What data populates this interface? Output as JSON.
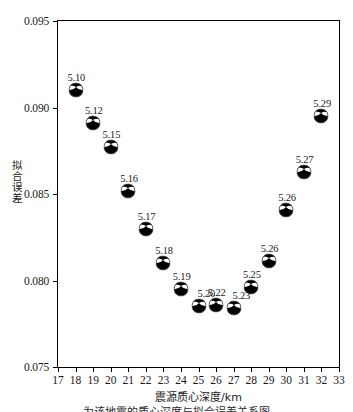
{
  "chart_data": {
    "type": "scatter",
    "title": "",
    "xlabel": "震源质心深度/km",
    "ylabel": "拟合误差",
    "xlim": [
      17,
      33
    ],
    "ylim": [
      0.075,
      0.095
    ],
    "grid": false,
    "legend": null,
    "x_ticks": [
      "17",
      "18",
      "19",
      "20",
      "21",
      "22",
      "23",
      "24",
      "25",
      "26",
      "27",
      "28",
      "29",
      "30",
      "31",
      "32",
      "33"
    ],
    "y_ticks": [
      "0.075",
      "0.080",
      "0.085",
      "0.090",
      "0.095"
    ],
    "marker": "beachball",
    "points": [
      {
        "x": 18,
        "y": 0.091,
        "label": "5.10",
        "label_pos": "center"
      },
      {
        "x": 19,
        "y": 0.0891,
        "label": "5.12",
        "label_pos": "center"
      },
      {
        "x": 20,
        "y": 0.0877,
        "label": "5.15",
        "label_pos": "center"
      },
      {
        "x": 21,
        "y": 0.0852,
        "label": "5.16",
        "label_pos": "center"
      },
      {
        "x": 22,
        "y": 0.083,
        "label": "5.17",
        "label_pos": "center"
      },
      {
        "x": 23,
        "y": 0.081,
        "label": "5.18",
        "label_pos": "center"
      },
      {
        "x": 24,
        "y": 0.0795,
        "label": "5.19",
        "label_pos": "center"
      },
      {
        "x": 25,
        "y": 0.0785,
        "label": "5.20",
        "label_pos": "right"
      },
      {
        "x": 26,
        "y": 0.0786,
        "label": "5.22",
        "label_pos": "center"
      },
      {
        "x": 27,
        "y": 0.0784,
        "label": "5.23",
        "label_pos": "right"
      },
      {
        "x": 28,
        "y": 0.0796,
        "label": "5.25",
        "label_pos": "center"
      },
      {
        "x": 29,
        "y": 0.0811,
        "label": "5.26",
        "label_pos": "center"
      },
      {
        "x": 30,
        "y": 0.0841,
        "label": "5.26",
        "label_pos": "center"
      },
      {
        "x": 31,
        "y": 0.0863,
        "label": "5.27",
        "label_pos": "center"
      },
      {
        "x": 32,
        "y": 0.0895,
        "label": "5.29",
        "label_pos": "center"
      }
    ]
  },
  "axes": {
    "x_title": "震源质心深度/km",
    "y_title": "拟合误差"
  },
  "caption": {
    "text": "为该地震的质心深度与拟合误差关系图"
  },
  "colors": {
    "axis": "#000000",
    "marker_dark": "#000000",
    "marker_light": "#ffffff",
    "background": "#ffffff",
    "text": "#1a1a1a"
  }
}
